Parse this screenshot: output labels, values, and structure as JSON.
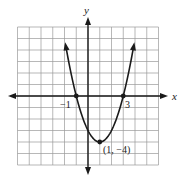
{
  "chart_data": {
    "type": "line",
    "title": "",
    "xlabel": "x",
    "ylabel": "y",
    "function": "y = (x - 1)^2 - 4",
    "xlim": [
      -6,
      6
    ],
    "ylim": [
      -6,
      6
    ],
    "grid": true,
    "grid_step": 1,
    "series": [
      {
        "name": "parabola",
        "x": [
          -1.9,
          -1.5,
          -1,
          -0.5,
          0,
          0.5,
          1,
          1.5,
          2,
          2.5,
          3,
          3.5,
          3.9
        ],
        "y": [
          4.41,
          2.25,
          0,
          -1.75,
          -3,
          -3.75,
          -4,
          -3.75,
          -3,
          -1.75,
          0,
          2.25,
          4.41
        ]
      }
    ],
    "points": [
      {
        "x": -1,
        "y": 0,
        "label": "-1"
      },
      {
        "x": 3,
        "y": 0,
        "label": "3"
      },
      {
        "x": 1,
        "y": -4,
        "label": "(1, -4)"
      }
    ],
    "annotations": [
      "-1",
      "3",
      "(1, -4)"
    ]
  },
  "labels": {
    "x_axis": "x",
    "y_axis": "y",
    "root_left": "−1",
    "root_right": "3",
    "vertex": "(1, −4)"
  },
  "colors": {
    "grid": "#9a9a9a",
    "axis": "#1a1a1a",
    "curve": "#1a1a1a",
    "border": "#9a9a9a"
  }
}
